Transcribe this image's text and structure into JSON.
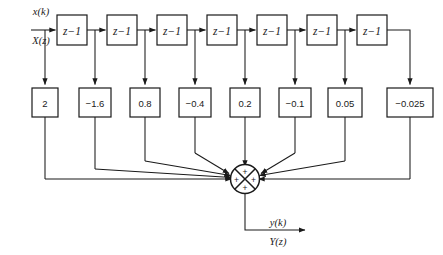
{
  "diagram": {
    "type": "block-diagram",
    "colors": {
      "line": "#1a1a1a",
      "box_fill": "#ffffff",
      "box_stroke": "#1a1a1a",
      "background": "#ffffff"
    },
    "input": {
      "label_top": "x(k)",
      "label_bottom": "X(z)"
    },
    "output": {
      "label_top": "y(k)",
      "label_bottom": "Y(z)"
    },
    "delay_blocks": [
      {
        "label": "z−1"
      },
      {
        "label": "z−1"
      },
      {
        "label": "z−1"
      },
      {
        "label": "z−1"
      },
      {
        "label": "z−1"
      },
      {
        "label": "z−1"
      },
      {
        "label": "z−1"
      }
    ],
    "coefficients": [
      {
        "label": "2"
      },
      {
        "label": "−1.6"
      },
      {
        "label": "0.8"
      },
      {
        "label": "−0.4"
      },
      {
        "label": "0.2"
      },
      {
        "label": "−0.1"
      },
      {
        "label": "0.05"
      },
      {
        "label": "−0.025"
      }
    ],
    "summing_junction": {
      "name": "summing-junction",
      "signs": [
        "+",
        "+",
        "+",
        "+"
      ]
    }
  }
}
